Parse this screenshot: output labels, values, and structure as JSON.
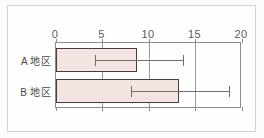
{
  "chart_data": {
    "type": "bar",
    "orientation": "horizontal",
    "title": "",
    "xlabel": "",
    "ylabel": "",
    "xlim": [
      0,
      20
    ],
    "grid": true,
    "legend": null,
    "categories": [
      "A 地区",
      "B 地区"
    ],
    "values": [
      8.7,
      13.2
    ],
    "error_low": [
      4.2,
      8.1
    ],
    "error_high": [
      13.7,
      18.6
    ],
    "ticks": [
      {
        "value": 0,
        "label": "0"
      },
      {
        "value": 5,
        "label": "5"
      },
      {
        "value": 10,
        "label": "10"
      },
      {
        "value": 15,
        "label": "15"
      },
      {
        "value": 20,
        "label": "20"
      }
    ],
    "series": [
      {
        "name": "value",
        "values": [
          8.7,
          13.2
        ]
      }
    ],
    "colors": {
      "bar_fill": "#f3e3e1",
      "bar_stroke": "#4a3c3a",
      "axis": "#8c8c8c",
      "grid": "#9a9a9a",
      "error_bar": "#7a6a68",
      "text": "#4a4a4a",
      "frame": "#d8cfcf",
      "background": "#fffefe"
    }
  },
  "axis": {
    "tick_labels": [
      "0",
      "5",
      "10",
      "15",
      "20"
    ]
  },
  "categories": {
    "a_label": "A 地区",
    "b_label": "B 地区"
  }
}
